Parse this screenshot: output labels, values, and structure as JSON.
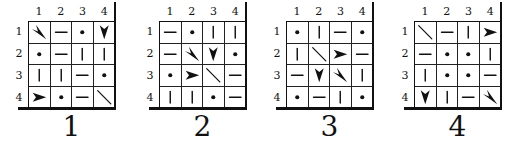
{
  "column_numbers": [
    "1",
    "2",
    "3",
    "4"
  ],
  "row_numbers": [
    "1",
    "2",
    "3",
    "4"
  ],
  "symbol_legend": {
    "dot": "filled dot",
    "h": "horizontal line",
    "v": "vertical line",
    "diag": "diagonal line (top-left to bottom-right)",
    "arrow-right": "arrowhead pointing right",
    "arrow-down": "arrowhead pointing down",
    "arrow-downright": "arrowhead pointing down-right"
  },
  "puzzles": [
    {
      "label": "1",
      "x": 0,
      "cells": [
        [
          "arrow-downright",
          "h",
          "dot",
          "arrow-down"
        ],
        [
          "dot",
          "h",
          "v",
          "v"
        ],
        [
          "v",
          "v",
          "h",
          "dot"
        ],
        [
          "arrow-right",
          "dot",
          "h",
          "diag"
        ]
      ]
    },
    {
      "label": "2",
      "x": 131,
      "cells": [
        [
          "h",
          "dot",
          "v",
          "v"
        ],
        [
          "h",
          "arrow-downright",
          "arrow-down",
          "dot"
        ],
        [
          "dot",
          "arrow-right",
          "diag",
          "h"
        ],
        [
          "v",
          "v",
          "dot",
          "h"
        ]
      ]
    },
    {
      "label": "3",
      "x": 258,
      "cells": [
        [
          "dot",
          "v",
          "h",
          "dot"
        ],
        [
          "v",
          "diag",
          "arrow-right",
          "h"
        ],
        [
          "h",
          "arrow-down",
          "arrow-downright",
          "v"
        ],
        [
          "dot",
          "h",
          "v",
          "dot"
        ]
      ]
    },
    {
      "label": "4",
      "x": 386,
      "cells": [
        [
          "diag",
          "h",
          "v",
          "arrow-right"
        ],
        [
          "h",
          "dot",
          "dot",
          "v"
        ],
        [
          "v",
          "dot",
          "dot",
          "h"
        ],
        [
          "arrow-down",
          "v",
          "h",
          "arrow-downright"
        ]
      ]
    }
  ]
}
